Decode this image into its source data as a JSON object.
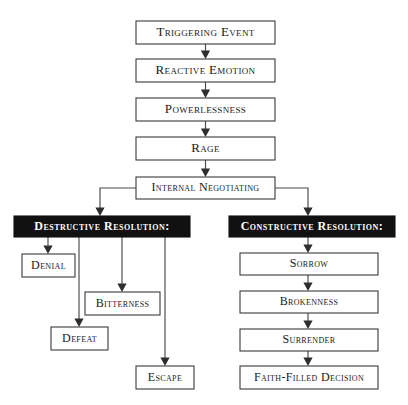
{
  "chart_data": {
    "type": "diagram",
    "diagram_kind": "flowchart",
    "orientation": "top-down",
    "background_color": "#ffffff",
    "box_fill_light": "#ffffff",
    "box_fill_dark": "#111111",
    "border_color": "#3a3a3a",
    "text_color_light_box": "#1a1a1a",
    "text_color_dark_box": "#ffffff",
    "text_style": "small-caps serif",
    "nodes": [
      {
        "id": "triggering_event",
        "label": "Triggering Event",
        "style": "light",
        "x": 136,
        "y": 21,
        "w": 139,
        "h": 23,
        "font_size": 13
      },
      {
        "id": "reactive_emotion",
        "label": "Reactive Emotion",
        "style": "light",
        "x": 136,
        "y": 59,
        "w": 139,
        "h": 23,
        "font_size": 13
      },
      {
        "id": "powerlessness",
        "label": "Powerlessness",
        "style": "light",
        "x": 136,
        "y": 98,
        "w": 139,
        "h": 23,
        "font_size": 13
      },
      {
        "id": "rage",
        "label": "Rage",
        "style": "light",
        "x": 136,
        "y": 137,
        "w": 139,
        "h": 23,
        "font_size": 13
      },
      {
        "id": "internal_negotiating",
        "label": "Internal Negotiating",
        "style": "light",
        "x": 136,
        "y": 177,
        "w": 139,
        "h": 22,
        "font_size": 12
      },
      {
        "id": "destructive_resolution",
        "label": "Destructive Resolution:",
        "style": "dark",
        "x": 14,
        "y": 216,
        "w": 176,
        "h": 21,
        "font_size": 12
      },
      {
        "id": "constructive_resolution",
        "label": "Constructive Resolution:",
        "style": "dark",
        "x": 229,
        "y": 216,
        "w": 166,
        "h": 21,
        "font_size": 12
      },
      {
        "id": "denial",
        "label": "Denial",
        "style": "light",
        "x": 22,
        "y": 254,
        "w": 53,
        "h": 23,
        "font_size": 12
      },
      {
        "id": "bitterness",
        "label": "Bitterness",
        "style": "light",
        "x": 85,
        "y": 292,
        "w": 75,
        "h": 23,
        "font_size": 12
      },
      {
        "id": "defeat",
        "label": "Defeat",
        "style": "light",
        "x": 51,
        "y": 327,
        "w": 57,
        "h": 23,
        "font_size": 12
      },
      {
        "id": "escape",
        "label": "Escape",
        "style": "light",
        "x": 136,
        "y": 366,
        "w": 58,
        "h": 23,
        "font_size": 12
      },
      {
        "id": "sorrow",
        "label": "Sorrow",
        "style": "light",
        "x": 240,
        "y": 253,
        "w": 138,
        "h": 22,
        "font_size": 12
      },
      {
        "id": "brokenness",
        "label": "Brokenness",
        "style": "light",
        "x": 240,
        "y": 291,
        "w": 138,
        "h": 22,
        "font_size": 12
      },
      {
        "id": "surrender",
        "label": "Surrender",
        "style": "light",
        "x": 240,
        "y": 329,
        "w": 138,
        "h": 22,
        "font_size": 12
      },
      {
        "id": "faith_filled_decision",
        "label": "Faith-Filled Decision",
        "style": "light",
        "x": 240,
        "y": 366,
        "w": 138,
        "h": 23,
        "font_size": 12
      }
    ],
    "edges": [
      {
        "from": "triggering_event",
        "to": "reactive_emotion",
        "kind": "straight-down",
        "path": "M205.5,44 L205.5,55",
        "arrow_at": [
          205.5,
          59
        ]
      },
      {
        "from": "reactive_emotion",
        "to": "powerlessness",
        "kind": "straight-down",
        "path": "M205.5,82 L205.5,94",
        "arrow_at": [
          205.5,
          98
        ]
      },
      {
        "from": "powerlessness",
        "to": "rage",
        "kind": "straight-down",
        "path": "M205.5,121 L205.5,133",
        "arrow_at": [
          205.5,
          137
        ]
      },
      {
        "from": "rage",
        "to": "internal_negotiating",
        "kind": "straight-down",
        "path": "M205.5,160 L205.5,173",
        "arrow_at": [
          205.5,
          177
        ]
      },
      {
        "from": "internal_negotiating",
        "to": "destructive_resolution",
        "kind": "elbow-left",
        "path": "M136,188 L100,188 L100,212",
        "arrow_at": [
          100,
          216
        ]
      },
      {
        "from": "internal_negotiating",
        "to": "constructive_resolution",
        "kind": "elbow-right",
        "path": "M275,188 L308,188 L308,212",
        "arrow_at": [
          308,
          216
        ]
      },
      {
        "from": "destructive_resolution",
        "to": "denial",
        "kind": "straight-down",
        "path": "M48,237 L48,250",
        "arrow_at": [
          48,
          254
        ]
      },
      {
        "from": "destructive_resolution",
        "to": "defeat",
        "kind": "straight-down",
        "path": "M79,237 L79,323",
        "arrow_at": [
          79,
          327
        ]
      },
      {
        "from": "destructive_resolution",
        "to": "bitterness",
        "kind": "straight-down",
        "path": "M122,237 L122,288",
        "arrow_at": [
          122,
          292
        ]
      },
      {
        "from": "destructive_resolution",
        "to": "escape",
        "kind": "straight-down",
        "path": "M165,237 L165,362",
        "arrow_at": [
          165,
          366
        ]
      },
      {
        "from": "constructive_resolution",
        "to": "sorrow",
        "kind": "straight-down",
        "path": "M308,237 L308,249",
        "arrow_at": [
          308,
          253
        ]
      },
      {
        "from": "sorrow",
        "to": "brokenness",
        "kind": "straight-down",
        "path": "M308,275 L308,287",
        "arrow_at": [
          308,
          291
        ]
      },
      {
        "from": "brokenness",
        "to": "surrender",
        "kind": "straight-down",
        "path": "M308,313 L308,325",
        "arrow_at": [
          308,
          329
        ]
      },
      {
        "from": "surrender",
        "to": "faith_filled_decision",
        "kind": "straight-down",
        "path": "M308,351 L308,362",
        "arrow_at": [
          308,
          366
        ]
      }
    ]
  }
}
